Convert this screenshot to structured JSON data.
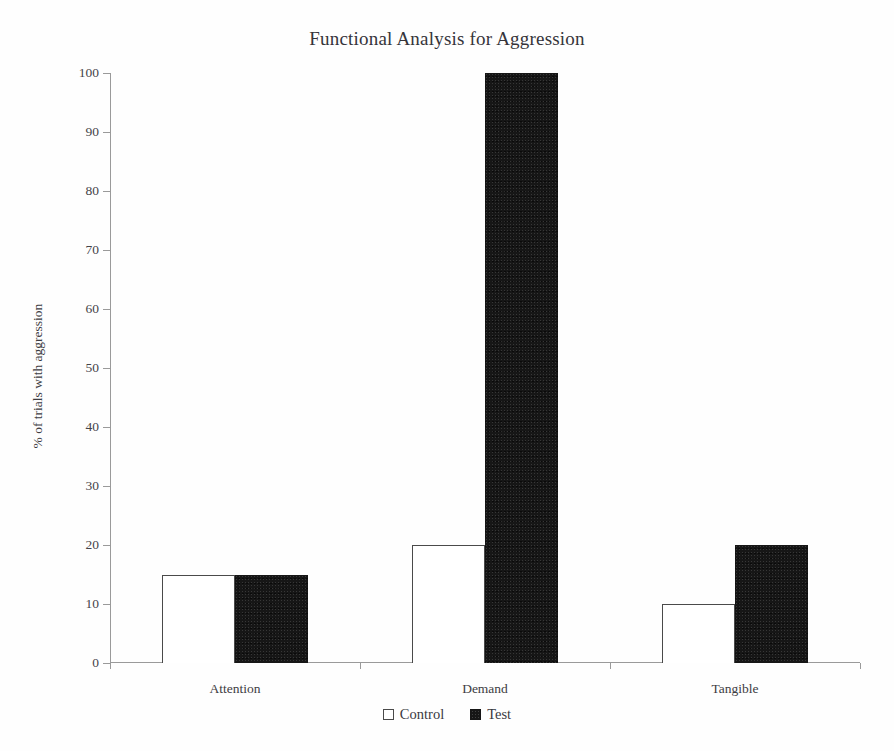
{
  "chart_data": {
    "type": "bar",
    "title": "Functional Analysis for Aggression",
    "xlabel": "",
    "ylabel": "% of trials with aggression",
    "categories": [
      "Attention",
      "Demand",
      "Tangible"
    ],
    "series": [
      {
        "name": "Control",
        "values": [
          15,
          20,
          10
        ],
        "fill": "#ffffff",
        "edge": "#4a4a4a"
      },
      {
        "name": "Test",
        "values": [
          15,
          100,
          20
        ],
        "fill": "#161616",
        "edge": "#161616"
      }
    ],
    "ylim": [
      0,
      100
    ],
    "yticks": [
      0,
      10,
      20,
      30,
      40,
      50,
      60,
      70,
      80,
      90,
      100
    ],
    "ytick_labels": [
      "0",
      "10",
      "20",
      "30",
      "40",
      "50",
      "60",
      "70",
      "80",
      "90",
      "100"
    ],
    "grid": false,
    "legend_position": "bottom-center",
    "legend_entries": [
      {
        "label": "Control",
        "marker": "open-square"
      },
      {
        "label": "Test",
        "marker": "filled-square"
      }
    ]
  }
}
